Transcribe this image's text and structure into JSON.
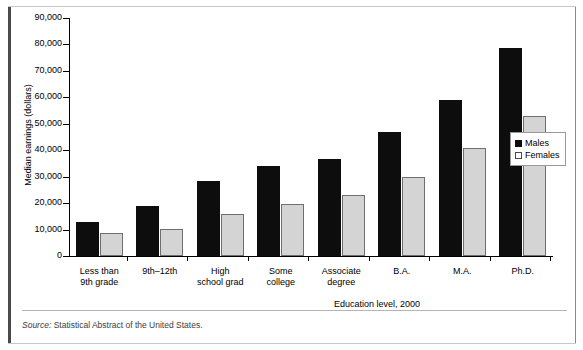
{
  "chart_data": {
    "type": "bar",
    "title": "",
    "xlabel": "Education level, 2000",
    "ylabel": "Median earnings (dollars)",
    "categories": [
      "Less than\n9th grade",
      "9th–12th",
      "High\nschool grad",
      "Some\ncollege",
      "Associate\ndegree",
      "B.A.",
      "M.A.",
      "Ph.D."
    ],
    "category_lines": [
      [
        "Less than",
        "9th grade"
      ],
      [
        "9th–12th",
        ""
      ],
      [
        "High",
        "school grad"
      ],
      [
        "Some",
        "college"
      ],
      [
        "Associate",
        "degree"
      ],
      [
        "B.A.",
        ""
      ],
      [
        "M.A.",
        ""
      ],
      [
        "Ph.D.",
        ""
      ]
    ],
    "series": [
      {
        "name": "Males",
        "color": "#0d0d0d",
        "values": [
          13000,
          19000,
          28500,
          34000,
          36500,
          47000,
          59000,
          78500
        ]
      },
      {
        "name": "Females",
        "color": "#d4d4d4",
        "values": [
          8800,
          10200,
          16000,
          19500,
          23000,
          30000,
          41000,
          53000
        ]
      }
    ],
    "ylim": [
      0,
      90000
    ],
    "yticks": [
      0,
      10000,
      20000,
      30000,
      40000,
      50000,
      60000,
      70000,
      80000,
      90000
    ],
    "ytick_labels": [
      "0",
      "10,000",
      "20,000",
      "30,000",
      "40,000",
      "50,000",
      "60,000",
      "70,000",
      "80,000",
      "90,000"
    ],
    "grid": false,
    "legend_position": "right"
  },
  "legend": {
    "entries": [
      {
        "label": "Males",
        "swatch": "filled-black-square"
      },
      {
        "label": "Females",
        "swatch": "open-white-square"
      }
    ]
  },
  "source": {
    "prefix": "Source:",
    "text": "Statistical Abstract of the United States."
  }
}
